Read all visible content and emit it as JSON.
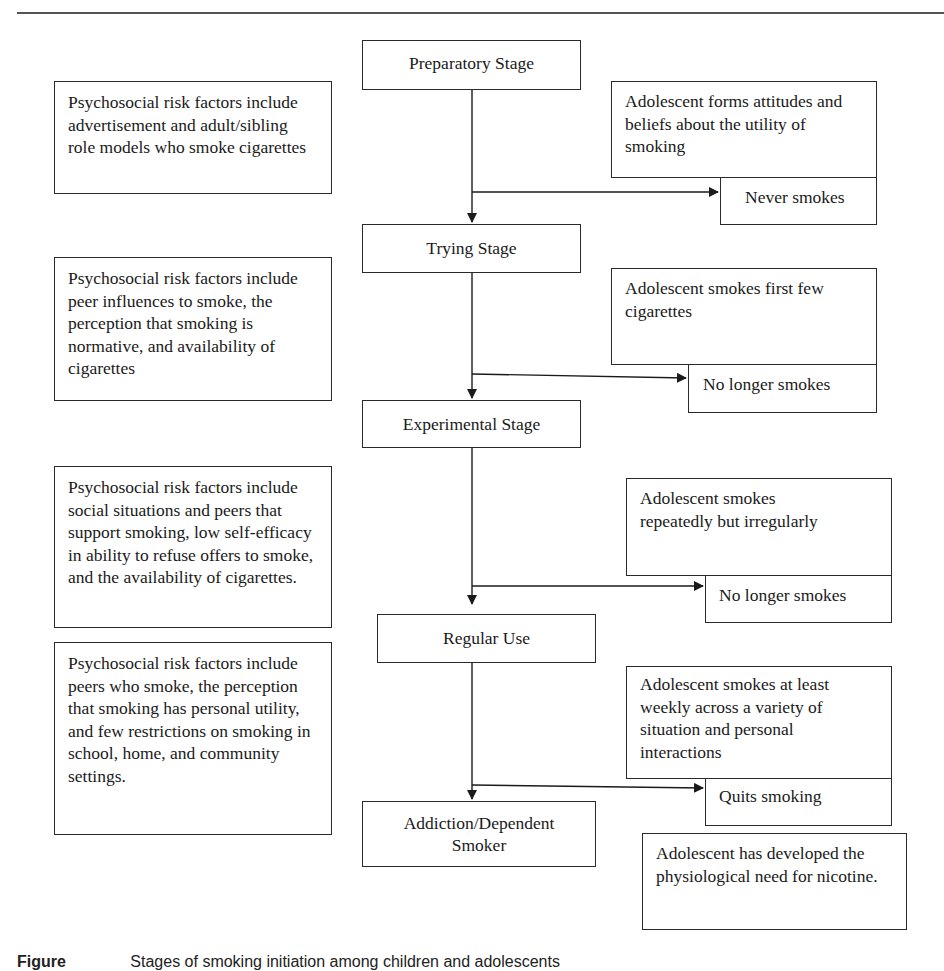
{
  "figure": {
    "title_rule": true,
    "stages": [
      {
        "id": "preparatory",
        "label": "Preparatory Stage"
      },
      {
        "id": "trying",
        "label": "Trying Stage"
      },
      {
        "id": "experimental",
        "label": "Experimental Stage"
      },
      {
        "id": "regular",
        "label": "Regular Use"
      },
      {
        "id": "addiction",
        "label": "Addiction/Dependent Smoker"
      }
    ],
    "risk_factors": [
      {
        "text": "Psychosocial risk factors include advertisement and adult/sibling role models who smoke cigarettes"
      },
      {
        "text": "Psychosocial risk factors include peer influences to smoke, the perception that smoking is normative, and availability of cigarettes"
      },
      {
        "text": "Psychosocial risk factors include social situations and peers that support smoking, low self-efficacy in ability to refuse offers to smoke, and the availability of cigarettes."
      },
      {
        "text": "Psychosocial risk factors include peers who smoke, the perception that smoking has personal utility, and few restrictions on smoking in school, home, and community settings."
      }
    ],
    "descriptions": [
      {
        "text": "Adolescent forms attitudes and beliefs about the utility of smoking"
      },
      {
        "text": "Adolescent smokes first few cigarettes"
      },
      {
        "text": "Adolescent smokes repeatedly but irregularly"
      },
      {
        "text": "Adolescent smokes at least weekly across a variety of situation and personal interactions"
      },
      {
        "text": "Adolescent has developed the physiological need for nicotine."
      }
    ],
    "exits": [
      {
        "label": "Never smokes"
      },
      {
        "label": "No longer smokes"
      },
      {
        "label": "No longer smokes"
      },
      {
        "label": "Quits smoking"
      }
    ],
    "caption": {
      "label": "Figure",
      "text": "Stages of smoking initiation among children and adolescents"
    }
  }
}
